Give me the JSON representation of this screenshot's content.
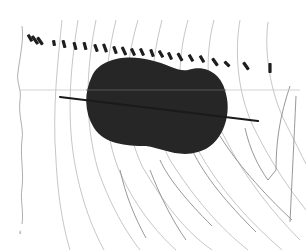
{
  "map": {
    "width": 306,
    "height": 250,
    "background": "#ffffff",
    "colors": {
      "contour": "#b8b8b8",
      "contour_dark": "#8c8c8c",
      "coastline": "#9a9a9a",
      "blob_fill": "#262626",
      "blob_inner": "#333333",
      "marker": "#1e1e1e",
      "axis_line": "#c8c8c8",
      "rod": "#1a1a1a"
    },
    "corner_mark": "ᵻ",
    "blob": {
      "description": "dark peanut-shaped region",
      "path": "M92,76 C100,58 128,54 150,60 C168,64 178,72 188,70 C206,64 222,74 226,94 C232,116 222,146 198,152 C178,158 162,148 146,146 C126,146 104,144 94,128 C84,112 84,92 92,76 Z"
    },
    "rod": {
      "x1": 60,
      "y1": 97,
      "x2": 258,
      "y2": 121
    },
    "horizontal_line": {
      "y": 90,
      "x1": 20,
      "x2": 300
    },
    "markers": [
      {
        "x": 30,
        "y": 38,
        "angle": 60,
        "len": 8
      },
      {
        "x": 35,
        "y": 40,
        "angle": 55,
        "len": 10
      },
      {
        "x": 40,
        "y": 41,
        "angle": 55,
        "len": 9
      },
      {
        "x": 54,
        "y": 43,
        "angle": 80,
        "len": 6
      },
      {
        "x": 64,
        "y": 44,
        "angle": 75,
        "len": 8
      },
      {
        "x": 75,
        "y": 46,
        "angle": 75,
        "len": 8
      },
      {
        "x": 85,
        "y": 46,
        "angle": 75,
        "len": 8
      },
      {
        "x": 96,
        "y": 48,
        "angle": 70,
        "len": 8
      },
      {
        "x": 105,
        "y": 48,
        "angle": 70,
        "len": 9
      },
      {
        "x": 115,
        "y": 50,
        "angle": 70,
        "len": 8
      },
      {
        "x": 124,
        "y": 51,
        "angle": 65,
        "len": 9
      },
      {
        "x": 133,
        "y": 52,
        "angle": 65,
        "len": 8
      },
      {
        "x": 142,
        "y": 52,
        "angle": 65,
        "len": 8
      },
      {
        "x": 152,
        "y": 53,
        "angle": 70,
        "len": 8
      },
      {
        "x": 161,
        "y": 54,
        "angle": 60,
        "len": 8
      },
      {
        "x": 170,
        "y": 56,
        "angle": 65,
        "len": 8
      },
      {
        "x": 180,
        "y": 57,
        "angle": 60,
        "len": 9
      },
      {
        "x": 191,
        "y": 58,
        "angle": 60,
        "len": 8
      },
      {
        "x": 202,
        "y": 59,
        "angle": 60,
        "len": 8
      },
      {
        "x": 215,
        "y": 62,
        "angle": 55,
        "len": 9
      },
      {
        "x": 227,
        "y": 64,
        "angle": 45,
        "len": 7
      },
      {
        "x": 246,
        "y": 66,
        "angle": 55,
        "len": 9
      },
      {
        "x": 270,
        "y": 68,
        "angle": 90,
        "len": 10
      }
    ],
    "contours": [
      "M62,20 C58,60 52,110 56,160 C58,200 64,230 70,250",
      "M78,20 C70,70 66,120 76,170 C84,210 96,235 104,250",
      "M96,20 C86,70 84,120 98,170 C110,205 126,232 140,250",
      "M116,20 C104,70 100,120 118,168 C134,205 156,232 176,250",
      "M138,20 C124,68 120,118 142,166 C164,204 186,232 212,250",
      "M162,20 C150,66 146,116 170,160 C194,198 220,228 248,250",
      "M188,20 C176,62 176,112 198,150 C220,190 250,222 282,250",
      "M214,20 C204,58 206,104 226,140 C244,176 272,212 300,240",
      "M240,20 C234,54 238,98 256,132 C272,164 290,190 306,210",
      "M268,22 C264,52 270,90 284,120 C294,140 302,156 306,164"
    ],
    "contours_dark": [
      "M160,160 C168,178 186,200 212,226",
      "M192,150 C206,178 226,202 256,232",
      "M245,128 C250,150 258,166 268,180 L276,170 C276,140 280,116 290,86",
      "M296,96 C294,140 292,180 290,222",
      "M150,170 C160,196 172,220 186,240",
      "M120,170 C126,196 134,216 146,238",
      "M220,136 C236,162 262,192 292,220"
    ],
    "coastline": "M22,26 C24,40 20,56 18,72 C16,82 22,90 20,100 C18,116 24,128 22,140 C20,156 24,172 22,188 C20,200 24,212 22,224"
  }
}
